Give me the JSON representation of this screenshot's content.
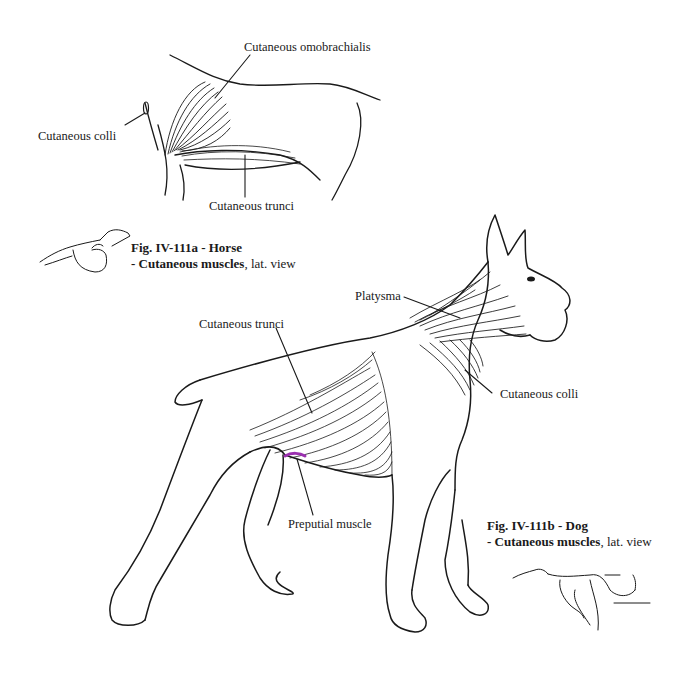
{
  "horse_figure": {
    "labels": {
      "omobrachialis": "Cutaneous omobrachialis",
      "colli": "Cutaneous colli",
      "trunci": "Cutaneous trunci"
    },
    "caption": {
      "fig": "Fig. IV-111a - Horse",
      "subtitle_bold": "- Cutaneous muscles",
      "subtitle_rest": ", lat. view"
    }
  },
  "dog_figure": {
    "labels": {
      "platysma": "Platysma",
      "trunci": "Cutaneous trunci",
      "colli": "Cutaneous colli",
      "preputial": "Preputial muscle"
    },
    "caption": {
      "fig": "Fig. IV-111b - Dog",
      "subtitle_bold": "- Cutaneous muscles",
      "subtitle_rest": ", lat. view"
    }
  },
  "colors": {
    "ink": "#1a1a1a",
    "background": "#ffffff",
    "preputial_highlight": "#9b30b0"
  }
}
